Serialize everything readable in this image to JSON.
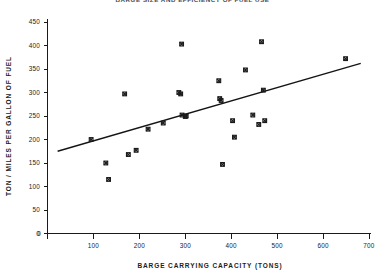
{
  "chart_data": {
    "type": "scatter",
    "title": "BARGE SIZE AND EFFICIENCY OF FUEL USE",
    "xlabel": "BARGE CARRYING CAPACITY (TONS)",
    "ylabel": "TON / MILES PER GALLON OF FUEL",
    "xlim": [
      0,
      700
    ],
    "ylim": [
      0,
      450
    ],
    "xticks": [
      0,
      100,
      200,
      300,
      400,
      500,
      600,
      700
    ],
    "yticks": [
      0,
      50,
      100,
      150,
      200,
      250,
      300,
      350,
      400,
      450
    ],
    "xtick_labels": [
      "0",
      "100",
      "200",
      "300",
      "400",
      "500",
      "600",
      "700"
    ],
    "ytick_labels": [
      "0",
      "50",
      "100",
      "150",
      "200",
      "250",
      "300",
      "350",
      "400",
      "450"
    ],
    "grid": false,
    "legend": "none",
    "marker_style": "x-square",
    "points": [
      {
        "x": 95,
        "y": 200
      },
      {
        "x": 127,
        "y": 150
      },
      {
        "x": 133,
        "y": 115
      },
      {
        "x": 168,
        "y": 297
      },
      {
        "x": 176,
        "y": 168
      },
      {
        "x": 193,
        "y": 177
      },
      {
        "x": 219,
        "y": 222
      },
      {
        "x": 252,
        "y": 235
      },
      {
        "x": 286,
        "y": 300
      },
      {
        "x": 290,
        "y": 297
      },
      {
        "x": 292,
        "y": 403
      },
      {
        "x": 293,
        "y": 252
      },
      {
        "x": 300,
        "y": 249
      },
      {
        "x": 302,
        "y": 250
      },
      {
        "x": 373,
        "y": 325
      },
      {
        "x": 375,
        "y": 287
      },
      {
        "x": 378,
        "y": 283
      },
      {
        "x": 381,
        "y": 147
      },
      {
        "x": 403,
        "y": 240
      },
      {
        "x": 407,
        "y": 205
      },
      {
        "x": 431,
        "y": 348
      },
      {
        "x": 447,
        "y": 252
      },
      {
        "x": 460,
        "y": 232
      },
      {
        "x": 466,
        "y": 408
      },
      {
        "x": 470,
        "y": 305
      },
      {
        "x": 473,
        "y": 240
      },
      {
        "x": 649,
        "y": 372
      }
    ],
    "fit_line": {
      "type": "linear-regression",
      "x_start": 22,
      "y_start": 175,
      "x_end": 682,
      "y_end": 362
    }
  }
}
